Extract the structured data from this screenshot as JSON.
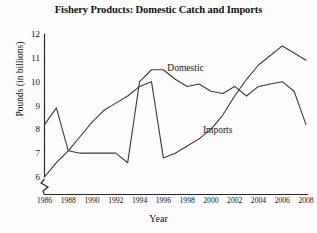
{
  "chart_data": {
    "type": "line",
    "title": "Fishery Products: Domestic Catch and Imports",
    "xlabel": "Year",
    "ylabel": "Pounds (in billions)",
    "xlim": [
      1986,
      2008
    ],
    "ylim": [
      6,
      12
    ],
    "yticks": [
      6,
      7,
      8,
      9,
      10,
      11,
      12
    ],
    "xticks": [
      1986,
      1988,
      1990,
      1992,
      1994,
      1996,
      1998,
      2000,
      2002,
      2004,
      2006,
      2008
    ],
    "grid": false,
    "y_axis_break": true,
    "legend_position": "inline-annotations",
    "x": [
      1986,
      1987,
      1988,
      1989,
      1990,
      1991,
      1992,
      1993,
      1994,
      1995,
      1996,
      1997,
      1998,
      1999,
      2000,
      2001,
      2002,
      2003,
      2004,
      2005,
      2006,
      2007,
      2008
    ],
    "series": [
      {
        "name": "Domestic",
        "values": [
          8.2,
          8.9,
          7.1,
          7.0,
          7.0,
          7.0,
          7.0,
          6.6,
          10.0,
          10.5,
          10.5,
          10.1,
          9.8,
          9.9,
          9.6,
          9.5,
          9.8,
          9.4,
          9.8,
          9.9,
          10.0,
          9.6,
          8.2
        ]
      },
      {
        "name": "Imports",
        "values": [
          6.0,
          6.6,
          7.1,
          7.7,
          8.3,
          8.8,
          9.1,
          9.4,
          9.8,
          10.0,
          6.8,
          7.0,
          7.3,
          7.6,
          8.0,
          8.6,
          9.4,
          10.1,
          10.7,
          11.1,
          11.5,
          11.2,
          10.9
        ]
      }
    ],
    "annotations": [
      {
        "text": "Domestic",
        "x": 1996,
        "y": 10.55
      },
      {
        "text": "Imports",
        "x": 2000,
        "y": 7.95
      }
    ],
    "line_color": "#3a3a3a"
  }
}
